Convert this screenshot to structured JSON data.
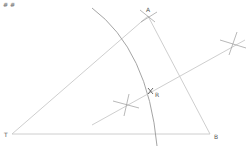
{
  "diagram": {
    "type": "geometric-construction",
    "corner_marks": "# #",
    "colors": {
      "line": "#c8c8c8",
      "arc": "#9a9a9a",
      "label": "#555555",
      "mark": "#777777"
    },
    "points": {
      "T": {
        "label": "T",
        "x": 12,
        "y": 134
      },
      "B": {
        "label": "B",
        "x": 210,
        "y": 134
      },
      "A": {
        "label": "A",
        "x": 148,
        "y": 16
      },
      "R": {
        "label": "R",
        "x": 151,
        "y": 91
      }
    },
    "segments": [
      {
        "name": "TB",
        "from": "T",
        "to": "B"
      },
      {
        "name": "TA",
        "from": "T",
        "to": "A"
      },
      {
        "name": "AB",
        "from": "A",
        "to": "B"
      }
    ],
    "bisector": {
      "x1": 92,
      "y1": 125,
      "x2": 245,
      "y2": 40
    },
    "construction_marks": [
      {
        "x": 126,
        "y": 105
      },
      {
        "x": 233,
        "y": 43
      }
    ]
  }
}
